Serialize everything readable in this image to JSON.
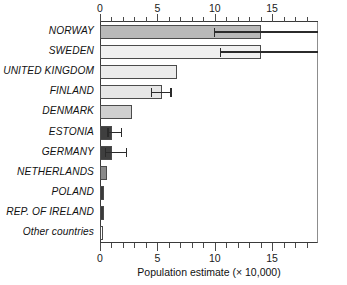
{
  "chart_data": {
    "type": "bar",
    "orientation": "horizontal",
    "title": "",
    "xlabel": "Population estimate (× 10,000)",
    "ylabel": "",
    "xlim": [
      0,
      19
    ],
    "grid": false,
    "legend": null,
    "axis_ticks_major": [
      0,
      5,
      10,
      15
    ],
    "axis_tick_labels": [
      "0",
      "5",
      "10",
      "15"
    ],
    "axis_ticks_minor": [
      1,
      2,
      3,
      4,
      6,
      7,
      8,
      9,
      11,
      12,
      13,
      14,
      16,
      17,
      18
    ],
    "axis_top": true,
    "axis_bottom": true,
    "categories": [
      "NORWAY",
      "SWEDEN",
      "UNITED KINGDOM",
      "FINLAND",
      "DENMARK",
      "ESTONIA",
      "GERMANY",
      "NETHERLANDS",
      "POLAND",
      "REP. OF IRELAND",
      "Other countries"
    ],
    "values": [
      14.0,
      14.0,
      6.7,
      5.4,
      2.8,
      1.05,
      1.05,
      0.6,
      0.35,
      0.35,
      0.3
    ],
    "bar_colors": [
      "#b9b9b9",
      "#f0f0f0",
      "#ececec",
      "#e6e6e6",
      "#cfcfcf",
      "#3f3f3f",
      "#3f3f3f",
      "#8a8a8a",
      "#3a3a3a",
      "#3a3a3a",
      "#ffffff"
    ],
    "error_bars": [
      {
        "category": "NORWAY",
        "low": 10.0,
        "high": 19.0,
        "clipped_right": true
      },
      {
        "category": "SWEDEN",
        "low": 10.5,
        "high": 19.0,
        "clipped_right": true
      },
      {
        "category": "FINLAND",
        "low": 4.5,
        "high": 6.2,
        "clipped_right": false
      },
      {
        "category": "ESTONIA",
        "low": 0.7,
        "high": 1.9,
        "clipped_right": false
      },
      {
        "category": "GERMANY",
        "low": 0.5,
        "high": 2.3,
        "clipped_right": false
      }
    ]
  }
}
